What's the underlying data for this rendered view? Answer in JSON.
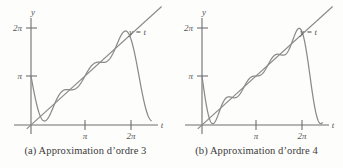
{
  "figure": {
    "background": "#fdfdfc",
    "stroke_color": "#8a8a8a",
    "text_color": "#555555",
    "caption_color": "#3a3a3a"
  },
  "panels": [
    {
      "id": "a",
      "caption": "(a) Approximation d’ordre 3",
      "order": 3,
      "axis": {
        "x_label": "t",
        "y_label": "y",
        "x_ticks": [
          {
            "label": "π",
            "value": 3.14159
          },
          {
            "label": "2π",
            "value": 6.28319
          }
        ],
        "y_ticks": [
          {
            "label": "π",
            "value": 3.14159
          },
          {
            "label": "2π",
            "value": 6.28319
          }
        ]
      },
      "line_label": "y = t"
    },
    {
      "id": "b",
      "caption": "(b) Approximation d’ordre 4",
      "order": 4,
      "axis": {
        "x_label": "t",
        "y_label": "y",
        "x_ticks": [
          {
            "label": "π",
            "value": 3.14159
          },
          {
            "label": "2π",
            "value": 6.28319
          }
        ],
        "y_ticks": [
          {
            "label": "π",
            "value": 3.14159
          },
          {
            "label": "2π",
            "value": 6.28319
          }
        ]
      },
      "line_label": "y = t"
    }
  ],
  "chart_data": {
    "type": "line",
    "title": "",
    "xlabel": "t",
    "ylabel": "y",
    "xlim": [
      -0.55,
      7.9
    ],
    "ylim": [
      -0.75,
      7.35
    ],
    "grid": false,
    "legend": false,
    "series": [
      {
        "name": "y = t",
        "panel": "both",
        "kind": "identity-line",
        "x": [
          -0.25,
          7.6
        ],
        "y": [
          -0.25,
          7.6
        ]
      },
      {
        "name": "Fourier partial sum order 3",
        "panel": "a",
        "kind": "fourier-sawtooth",
        "formula": "y = pi - 2*sum_{n=1..3} sin(n*t)/n",
        "harmonics": 3,
        "domain": [
          0.0,
          7.0
        ],
        "samples_x": [
          0.0,
          0.35,
          0.7,
          1.05,
          1.4,
          1.75,
          2.1,
          2.45,
          2.8,
          3.15,
          3.5,
          3.85,
          4.2,
          4.55,
          4.9,
          5.25,
          5.6,
          5.95,
          6.3,
          6.65,
          7.0
        ],
        "samples_y": [
          3.1416,
          1.1122,
          0.4536,
          0.6726,
          1.1832,
          1.5746,
          1.7649,
          1.9574,
          2.3498,
          2.9962,
          3.5916,
          3.9808,
          4.2233,
          4.5243,
          5.0139,
          5.5238,
          5.7241,
          5.2862,
          4.1019,
          2.4385,
          0.9086
        ]
      },
      {
        "name": "Fourier partial sum order 4",
        "panel": "b",
        "kind": "fourier-sawtooth",
        "formula": "y = pi - 2*sum_{n=1..4} sin(n*t)/n",
        "harmonics": 4,
        "domain": [
          0.0,
          7.0
        ],
        "samples_x": [
          0.0,
          0.35,
          0.7,
          1.05,
          1.4,
          1.75,
          2.1,
          2.45,
          2.8,
          3.15,
          3.5,
          3.85,
          4.2,
          4.55,
          4.9,
          5.25,
          5.6,
          5.95,
          6.3,
          6.65,
          7.0
        ],
        "samples_y": [
          3.1416,
          0.676,
          0.9029,
          1.1003,
          0.9525,
          1.4716,
          2.14,
          2.1002,
          2.118,
          2.8435,
          3.706,
          4.0558,
          3.8988,
          4.2264,
          5.1131,
          5.8277,
          5.8019,
          5.3268,
          4.3902,
          2.1922,
          0.4527
        ]
      }
    ]
  }
}
